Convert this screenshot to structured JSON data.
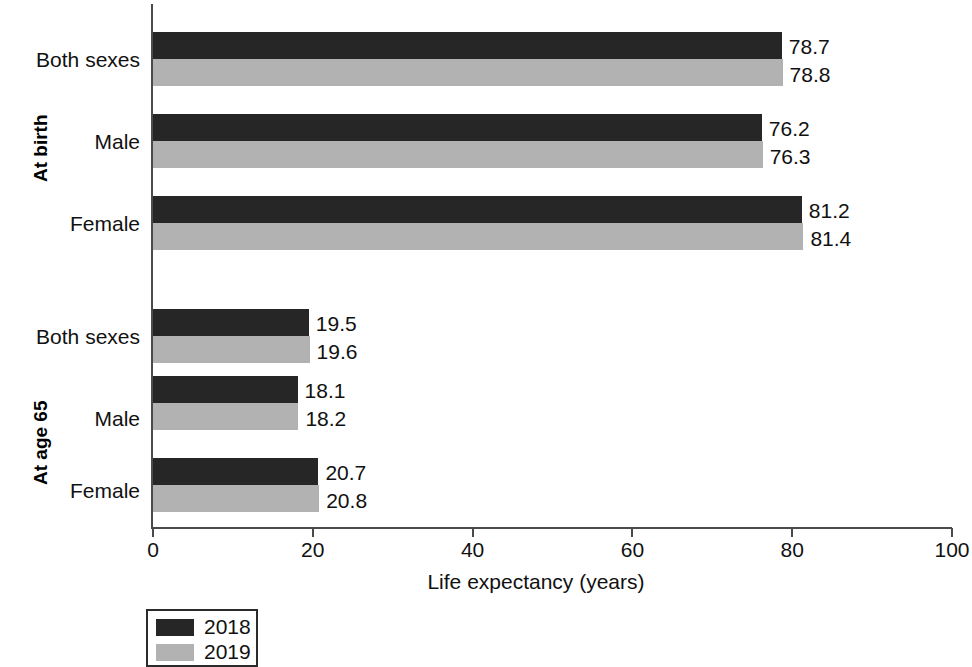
{
  "chart_data": {
    "type": "bar",
    "orientation": "horizontal",
    "title": "",
    "xlabel": "Life expectancy (years)",
    "ylabel": "",
    "xlim": [
      0,
      100
    ],
    "xticks": [
      0,
      20,
      40,
      60,
      80,
      100
    ],
    "xtick_labels": [
      "0",
      "20",
      "40",
      "60",
      "80",
      "100"
    ],
    "grid": false,
    "legend_position": "bottom-left",
    "groups": [
      {
        "name": "At birth",
        "categories": [
          "Both sexes",
          "Male",
          "Female"
        ],
        "values_2018": [
          78.7,
          76.2,
          81.2
        ],
        "values_2019": [
          78.8,
          76.3,
          81.4
        ],
        "labels_2018": [
          "78.7",
          "76.2",
          "81.2"
        ],
        "labels_2019": [
          "78.8",
          "76.3",
          "81.4"
        ]
      },
      {
        "name": "At age 65",
        "categories": [
          "Both sexes",
          "Male",
          "Female"
        ],
        "values_2018": [
          19.5,
          18.1,
          20.7
        ],
        "values_2019": [
          19.6,
          18.2,
          20.8
        ],
        "labels_2018": [
          "19.5",
          "18.1",
          "20.7"
        ],
        "labels_2019": [
          "19.6",
          "18.2",
          "20.8"
        ]
      }
    ],
    "series": [
      {
        "name": "2018",
        "color": "#262626"
      },
      {
        "name": "2019",
        "color": "#b2b2b2"
      }
    ],
    "legend": [
      "2018",
      "2019"
    ]
  },
  "legend": {
    "items": [
      {
        "label": "2018",
        "color": "#262626"
      },
      {
        "label": "2019",
        "color": "#b2b2b2"
      }
    ]
  },
  "axis": {
    "x_title": "Life expectancy (years)",
    "ticks": [
      "0",
      "20",
      "40",
      "60",
      "80",
      "100"
    ]
  },
  "groups": {
    "birth": "At birth",
    "age65": "At age 65"
  },
  "categories": {
    "both": "Both sexes",
    "male": "Male",
    "female": "Female"
  }
}
